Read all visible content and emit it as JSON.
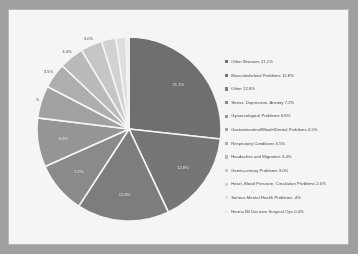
{
  "document": {
    "background_color": "#a0a0a0",
    "sheet_color": "#fbfbfa",
    "border_color": "#b9b9b7"
  },
  "chart_data": {
    "type": "pie",
    "title": "",
    "subtitle": "",
    "xlabel": "",
    "ylabel": "",
    "legend_position": "right",
    "grid": false,
    "value_suffix": "%",
    "categories": [
      "Other Illnesses",
      "Musculoskeletal Problems",
      "Other",
      "Stress, Depression, Anxiety",
      "Gynaecological Problems",
      "Gastrointestinal/Mouth/Dental Problems",
      "Respiratory Conditions",
      "Headaches and Migraines",
      "Genito-urinary Problems",
      "Heart, Blood Pressure, Circulation Problems",
      "Serious Mental Health Problems",
      "Hernia Nil Decisive Surgical Ops"
    ],
    "values": [
      21.1,
      12.8,
      12.8,
      7.2,
      6.8,
      4.5,
      3.5,
      3.4,
      3.0,
      2.0,
      1.4,
      0.4
    ],
    "labels": [
      "21.1%",
      "12.8%",
      "12.8%",
      "7.2%",
      "6.8%",
      "4.5%",
      "3.5%",
      "3.4%",
      "3.0%",
      "2.0%",
      "1.4%",
      "0.4%"
    ],
    "slice_colors": [
      "#6e6e6e",
      "#757575",
      "#7d7d7d",
      "#8a8a8a",
      "#969696",
      "#a2a2a2",
      "#b0b0b0",
      "#bdbdbd",
      "#c9c9c9",
      "#d6d6d6",
      "#e3e3e3",
      "#f0f0f0"
    ],
    "legend_entries": [
      "Other Illnesses 21.1%",
      "Musculoskeletal Problems 12.8%",
      "Other 12.8%",
      "Stress, Depression, Anxiety 7.2%",
      "Gynaecological Problems 6.8%",
      "Gastrointestinal/Mouth/Dental Problems 4.5%",
      "Respiratory Conditions 3.5%",
      "Headaches and Migraines 3.4%",
      "Genito-urinary Problems 3.0%",
      "Heart, Blood Pressure, Circulation Problems 2.0%",
      "Serious Mental Health Problems .4%",
      "Hernia Nil Decisive Surgical Ops 0.4%"
    ]
  }
}
